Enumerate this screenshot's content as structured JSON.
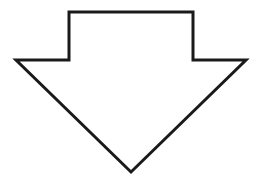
{
  "diagram": {
    "shape": "down-arrow",
    "stroke_color": "#1a1a1a",
    "fill_color": "#ffffff",
    "background": "#ffffff",
    "stroke_width": 3,
    "points": "69,12 193,12 193,60 246,60 131,172 16,60 69,60"
  }
}
